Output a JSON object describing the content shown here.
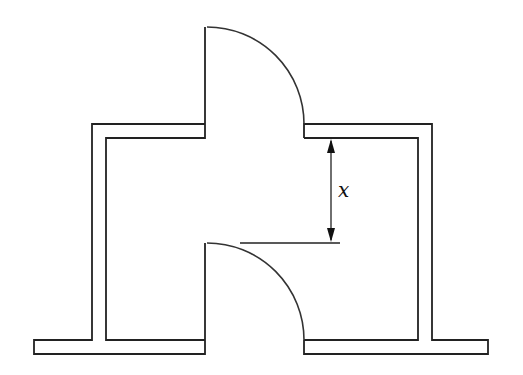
{
  "diagram": {
    "type": "floor-plan",
    "colors": {
      "line": "#222222",
      "background": "#ffffff"
    },
    "dimension": {
      "label": "x"
    }
  }
}
